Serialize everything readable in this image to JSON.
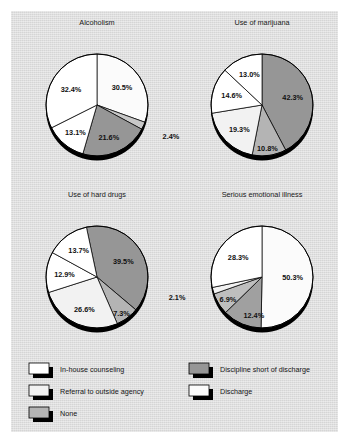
{
  "figure": {
    "background_color": "#ffffff",
    "panel_color": "#dcdcdc",
    "border_color": "#000000"
  },
  "legend": {
    "position": "bottom-left",
    "items": [
      {
        "label": "In-house counseling",
        "color": "#ffffff",
        "key": "in_house_counseling"
      },
      {
        "label": "Discipline short of discharge",
        "color": "#969696",
        "key": "discipline_short_of_discharge"
      },
      {
        "label": "Referral to outside agency",
        "color": "#f2f2f2",
        "key": "referral_to_outside_agency"
      },
      {
        "label": "Discharge",
        "color": "#fbfbfb",
        "key": "discharge"
      },
      {
        "label": "None",
        "color": "#b4b4b4",
        "key": "none"
      }
    ]
  },
  "chart_data": [
    {
      "type": "pie",
      "title": "Alcoholism",
      "labels": [
        "Discharge",
        "None",
        "Discipline short of discharge",
        "Referral to outside agency",
        "In-house counseling"
      ],
      "values": [
        30.5,
        2.4,
        21.6,
        13.1,
        32.4
      ],
      "value_labels": [
        "30.5%",
        "2.4%",
        "21.6%",
        "13.1%",
        "32.4%"
      ],
      "colors": [
        "#fbfbfb",
        "#c8c8c8",
        "#969696",
        "#ffffff",
        "#ffffff"
      ],
      "start_angle_deg": 0,
      "direction": "clockwise"
    },
    {
      "type": "pie",
      "title": "Use of marijuana",
      "labels": [
        "Discipline short of discharge",
        "None",
        "Referral to outside agency",
        "In-house counseling",
        "Discharge"
      ],
      "values": [
        42.3,
        10.8,
        19.3,
        14.6,
        13.0
      ],
      "value_labels": [
        "42.3%",
        "10.8%",
        "19.3%",
        "14.6%",
        "13.0%"
      ],
      "colors": [
        "#969696",
        "#b4b4b4",
        "#f2f2f2",
        "#ffffff",
        "#ffffff"
      ],
      "start_angle_deg": 0,
      "direction": "clockwise"
    },
    {
      "type": "pie",
      "title": "Use of hard drugs",
      "labels": [
        "Discipline short of discharge",
        "None",
        "Referral to outside agency",
        "In-house counseling",
        "Discharge"
      ],
      "values": [
        39.5,
        7.3,
        26.6,
        12.9,
        13.7
      ],
      "value_labels": [
        "39.5%",
        "7.3%",
        "26.6%",
        "12.9%",
        "13.7%"
      ],
      "colors": [
        "#969696",
        "#b4b4b4",
        "#f2f2f2",
        "#ffffff",
        "#ffffff"
      ],
      "start_angle_deg": 348,
      "direction": "clockwise"
    },
    {
      "type": "pie",
      "title": "Serious emotional illness",
      "labels": [
        "Discharge",
        "Discipline short of discharge",
        "None",
        "Referral to outside agency",
        "In-house counseling"
      ],
      "values": [
        50.3,
        12.4,
        6.9,
        2.1,
        28.3
      ],
      "value_labels": [
        "50.3%",
        "12.4%",
        "6.9%",
        "2.1%",
        "28.3%"
      ],
      "colors": [
        "#fbfbfb",
        "#a0a0a0",
        "#bebebe",
        "#f2f2f2",
        "#ffffff"
      ],
      "start_angle_deg": 0,
      "direction": "clockwise"
    }
  ]
}
